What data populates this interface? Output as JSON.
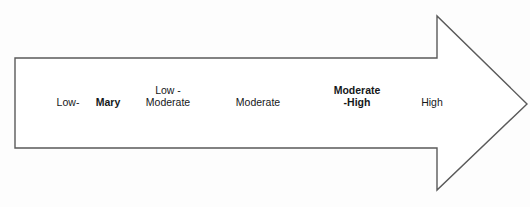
{
  "diagram": {
    "type": "right-pointing-arrow-scale",
    "shape": {
      "name": "block-arrow-right",
      "outline_color": "#5a5a5a",
      "fill_color": "#ffffff",
      "stroke_width_px": 1.4,
      "points": "15,58 437,58 437,16 527,104 437,190 437,148 15,148"
    },
    "background_color": "#fdfdfd",
    "text_color": "#16181a",
    "labels": [
      {
        "id": "low",
        "name": "scale-label-low",
        "lines": [
          "Low-"
        ],
        "bold": false,
        "center_x": 68,
        "baseline_y": 108
      },
      {
        "id": "mary",
        "name": "scale-label-mary",
        "lines": [
          "Mary"
        ],
        "bold": true,
        "center_x": 108,
        "baseline_y": 108
      },
      {
        "id": "low-moderate",
        "name": "scale-label-low-moderate",
        "lines": [
          "Low -",
          "Moderate"
        ],
        "bold": false,
        "center_x": 168,
        "baseline_y": 108
      },
      {
        "id": "moderate",
        "name": "scale-label-moderate",
        "lines": [
          "Moderate"
        ],
        "bold": false,
        "center_x": 258,
        "baseline_y": 108
      },
      {
        "id": "moderate-high",
        "name": "scale-label-moderate-high",
        "lines": [
          "Moderate",
          "-High"
        ],
        "bold": true,
        "center_x": 357,
        "baseline_y": 108
      },
      {
        "id": "high",
        "name": "scale-label-high",
        "lines": [
          "High"
        ],
        "bold": false,
        "center_x": 432,
        "baseline_y": 108
      }
    ]
  }
}
